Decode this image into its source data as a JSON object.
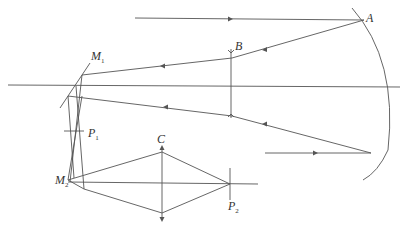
{
  "diagram": {
    "type": "optical-ray-diagram",
    "labels": {
      "A": "A",
      "B": "B",
      "C": "C",
      "M1": "M",
      "M1_sub": "1",
      "M2": "M",
      "M2_sub": "2",
      "P1": "P",
      "P1_sub": "1",
      "P2": "P",
      "P2_sub": "2"
    },
    "caption": "",
    "colors": {
      "line": "#555555",
      "text": "#333333",
      "background": "#ffffff"
    }
  }
}
